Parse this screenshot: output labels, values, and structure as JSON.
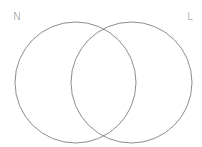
{
  "diagram": {
    "type": "venn",
    "sets": [
      {
        "label": "N",
        "cx": 75.5,
        "cy": 82.5,
        "r": 60.5
      },
      {
        "label": "L",
        "cx": 131.5,
        "cy": 82.5,
        "r": 60.5
      }
    ],
    "stroke_color": "#8c8c8c"
  }
}
